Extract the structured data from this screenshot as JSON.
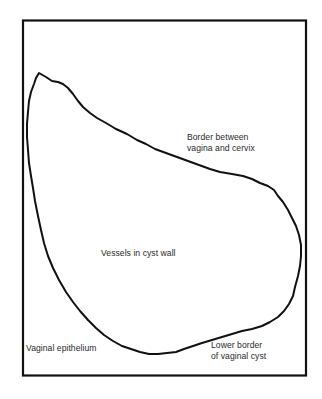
{
  "diagram": {
    "type": "anatomical-outline",
    "subject": "vaginal cyst",
    "colors": {
      "background": "#ffffff",
      "stroke": "#111111",
      "text": "#2a2a2a"
    },
    "labels": {
      "border_vagina_cervix": {
        "line1": "Border between",
        "line2": "vagina and cervix"
      },
      "vessels": "Vessels in cyst wall",
      "epithelium": "Vaginal epithelium",
      "lower_border": {
        "line1": "Lower border",
        "line2": "of vaginal cyst"
      }
    }
  }
}
